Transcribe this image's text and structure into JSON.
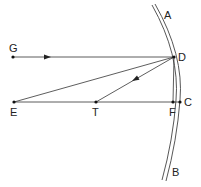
{
  "diagram": {
    "type": "optics-ray-diagram",
    "line_color": "#333333",
    "mirror_color": "#444444",
    "points": {
      "G": {
        "label": "G",
        "x": 13,
        "y": 57
      },
      "D": {
        "label": "D",
        "x": 174,
        "y": 57
      },
      "E": {
        "label": "E",
        "x": 14,
        "y": 102
      },
      "T": {
        "label": "T",
        "x": 96,
        "y": 102
      },
      "F": {
        "label": "F",
        "x": 173,
        "y": 102
      },
      "C": {
        "label": "C",
        "x": 180,
        "y": 102
      }
    },
    "mirror_labels": {
      "A": {
        "label": "A"
      },
      "B": {
        "label": "B"
      }
    },
    "lines": [
      {
        "from": "G",
        "to": "D",
        "arrow": true
      },
      {
        "from": "D",
        "to": "T",
        "arrow": true
      },
      {
        "from": "E",
        "to": "D",
        "arrow": false
      },
      {
        "from": "E",
        "to": "C",
        "arrow": false
      },
      {
        "from": "D",
        "to": "F",
        "arrow": false
      }
    ]
  }
}
